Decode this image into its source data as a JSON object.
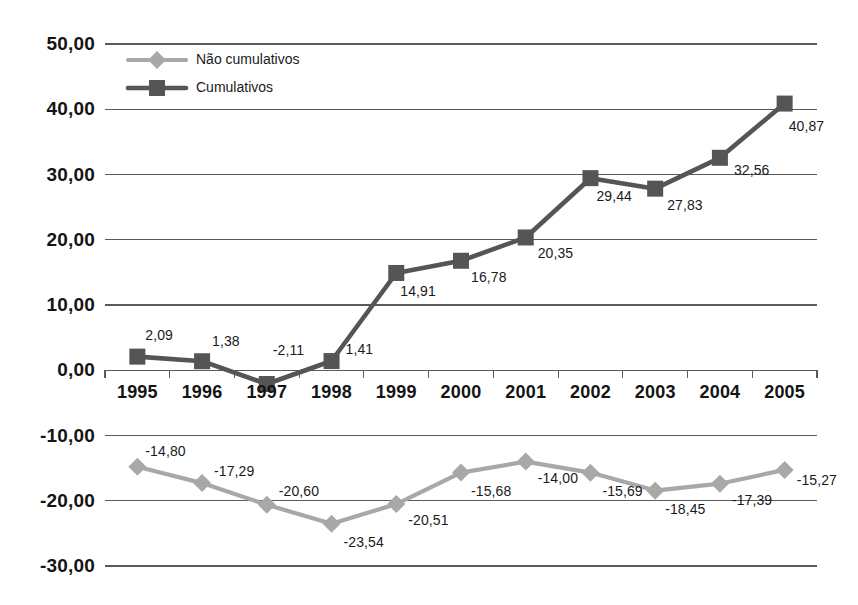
{
  "chart_data": {
    "type": "line",
    "title": "",
    "xlabel": "",
    "ylabel": "",
    "ylim": [
      -30,
      50
    ],
    "ytick_step": 10,
    "grid": true,
    "legend_position": "top-left-inside",
    "categories": [
      "1995",
      "1996",
      "1997",
      "1998",
      "1999",
      "2000",
      "2001",
      "2002",
      "2003",
      "2004",
      "2005"
    ],
    "series": [
      {
        "name": "Não cumulativos",
        "color": "#a8a8a8",
        "marker": "diamond",
        "values": [
          -14.8,
          -17.29,
          -20.6,
          -23.54,
          -20.51,
          -15.68,
          -14.0,
          -15.69,
          -18.45,
          -17.39,
          -15.27
        ],
        "labels": [
          "-14,80",
          "-17,29",
          "-20,60",
          "-23,54",
          "-20,51",
          "-15,68",
          "-14,00",
          "-15,69",
          "-18,45",
          "-17,39",
          "-15,27"
        ]
      },
      {
        "name": "Cumulativos",
        "color": "#555555",
        "marker": "square",
        "values": [
          2.09,
          1.38,
          -2.11,
          1.41,
          14.91,
          16.78,
          20.35,
          29.44,
          27.83,
          32.56,
          40.87
        ],
        "labels": [
          "2,09",
          "1,38",
          "-2,11",
          "1,41",
          "14,91",
          "16,78",
          "20,35",
          "29,44",
          "27,83",
          "32,56",
          "40,87"
        ]
      }
    ],
    "yticks": [
      {
        "value": 50,
        "label": "50,00"
      },
      {
        "value": 40,
        "label": "40,00"
      },
      {
        "value": 30,
        "label": "30,00"
      },
      {
        "value": 20,
        "label": "20,00"
      },
      {
        "value": 10,
        "label": "10,00"
      },
      {
        "value": 0,
        "label": "0,00"
      },
      {
        "value": -10,
        "label": "-10,00"
      },
      {
        "value": -20,
        "label": "-20,00"
      },
      {
        "value": -30,
        "label": "-30,00"
      }
    ]
  },
  "legend": {
    "items": [
      {
        "label": "Não cumulativos",
        "color": "#a8a8a8",
        "marker": "diamond"
      },
      {
        "label": "Cumulativos",
        "color": "#555555",
        "marker": "square"
      }
    ]
  },
  "colors": {
    "background": "#ffffff",
    "gridline": "#5a5a5a",
    "axis": "#5a5a5a",
    "series_light": "#a8a8a8",
    "series_dark": "#555555",
    "text": "#1a1a1a"
  },
  "label_offsets": {
    "cumulativos": [
      {
        "dx": 8,
        "dy": -30
      },
      {
        "dx": 10,
        "dy": -28
      },
      {
        "dx": 6,
        "dy": -42
      },
      {
        "dx": 14,
        "dy": -20
      },
      {
        "dx": 4,
        "dy": 10
      },
      {
        "dx": 10,
        "dy": 8
      },
      {
        "dx": 12,
        "dy": 8
      },
      {
        "dx": 6,
        "dy": 10
      },
      {
        "dx": 12,
        "dy": 8
      },
      {
        "dx": 14,
        "dy": 4
      },
      {
        "dx": 4,
        "dy": 14
      }
    ],
    "nao_cumulativos": [
      {
        "dx": 8,
        "dy": -24
      },
      {
        "dx": 12,
        "dy": -20
      },
      {
        "dx": 12,
        "dy": -22
      },
      {
        "dx": 12,
        "dy": 10
      },
      {
        "dx": 12,
        "dy": 8
      },
      {
        "dx": 10,
        "dy": 10
      },
      {
        "dx": 12,
        "dy": 8
      },
      {
        "dx": 12,
        "dy": 10
      },
      {
        "dx": 10,
        "dy": 10
      },
      {
        "dx": 12,
        "dy": 8
      },
      {
        "dx": 12,
        "dy": 2
      }
    ]
  }
}
